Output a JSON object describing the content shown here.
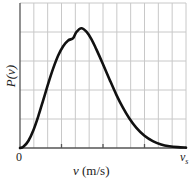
{
  "chart_data": {
    "type": "line",
    "title": "",
    "xlabel": "v (m/s)",
    "ylabel": "P(v)",
    "x_ticks": [
      "0",
      "vs"
    ],
    "grid": true,
    "grid_columns": 12,
    "grid_rows": 5,
    "xlim": [
      0,
      1
    ],
    "ylim": [
      0,
      1.2
    ],
    "series": [
      {
        "name": "P(v)",
        "x": [
          0,
          0.02,
          0.05,
          0.08,
          0.11,
          0.14,
          0.17,
          0.2,
          0.23,
          0.26,
          0.29,
          0.32,
          0.34,
          0.37,
          0.4,
          0.43,
          0.46,
          0.5,
          0.54,
          0.58,
          0.62,
          0.66,
          0.7,
          0.75,
          0.8,
          0.85,
          0.9,
          0.95,
          1.0
        ],
        "values": [
          0,
          0.0094,
          0.058,
          0.1453,
          0.2624,
          0.3968,
          0.5334,
          0.6588,
          0.7652,
          0.8423,
          0.8898,
          0.909,
          0.96,
          0.9914,
          0.9632,
          0.902,
          0.816,
          0.6937,
          0.5657,
          0.442,
          0.3332,
          0.2417,
          0.1688,
          0.1005,
          0.0565,
          0.0297,
          0.0148,
          0.007,
          0.0031
        ]
      }
    ],
    "peak": {
      "x": 0.34,
      "value": 0.96
    }
  },
  "labels": {
    "ylabel": "P(v)",
    "xlabel_var": "v",
    "xlabel_units": "(m/s)",
    "tick_zero": "0",
    "tick_end_var": "v",
    "tick_end_sub": "s"
  },
  "colors": {
    "grid": "#c8c8c8",
    "axis": "#555555",
    "curve": "#111111"
  }
}
